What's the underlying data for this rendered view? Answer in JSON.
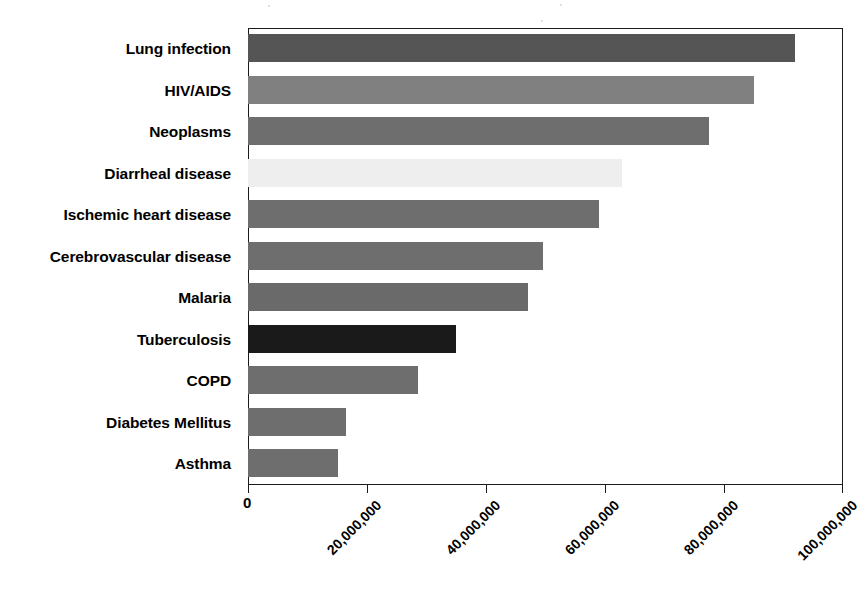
{
  "chart_data": {
    "type": "bar",
    "orientation": "horizontal",
    "title": "",
    "subtitle": "",
    "xlabel": "",
    "ylabel": "",
    "xlim": [
      0,
      100000000
    ],
    "ylim": null,
    "grid": false,
    "legend": null,
    "legend_position": "none",
    "x_tick_labels": [
      "0",
      "20,000,000",
      "40,000,000",
      "60,000,000",
      "80,000,000",
      "100,000,000"
    ],
    "x_tick_values": [
      0,
      20000000,
      40000000,
      60000000,
      80000000,
      100000000
    ],
    "categories": [
      "Lung infection",
      "HIV/AIDS",
      "Neoplasms",
      "Diarrheal disease",
      "Ischemic heart disease",
      "Cerebrovascular disease",
      "Malaria",
      "Tuberculosis",
      "COPD",
      "Diabetes Mellitus",
      "Asthma"
    ],
    "values": [
      92000000,
      85000000,
      77500000,
      62800000,
      59000000,
      49500000,
      47000000,
      35000000,
      28500000,
      16500000,
      15200000
    ],
    "bar_colors": [
      "#555555",
      "#808080",
      "#6e6e6e",
      "#eeeeee",
      "#6e6e6e",
      "#6e6e6e",
      "#6a6a6a",
      "#1a1a1a",
      "#6e6e6e",
      "#6e6e6e",
      "#6e6e6e"
    ],
    "bar_textures": [
      "solid",
      "dither",
      "solid",
      "faint",
      "solid",
      "solid",
      "dither",
      "solid",
      "solid",
      "solid",
      "solid"
    ]
  },
  "style": {
    "axis_color": "#1b1b1b",
    "background": "#ffffff",
    "label_color": "#000000"
  }
}
